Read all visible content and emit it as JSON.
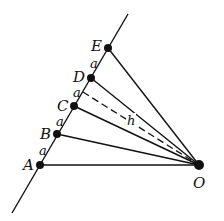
{
  "diagram": {
    "points": [
      {
        "id": "A",
        "label": "A",
        "x": 40,
        "y": 165,
        "lx": 22,
        "ly": 171
      },
      {
        "id": "B",
        "label": "B",
        "x": 57,
        "y": 134,
        "lx": 39,
        "ly": 139
      },
      {
        "id": "C",
        "label": "C",
        "x": 74,
        "y": 106,
        "lx": 56,
        "ly": 110
      },
      {
        "id": "D",
        "label": "D",
        "x": 91,
        "y": 78,
        "lx": 73,
        "ly": 81
      },
      {
        "id": "E",
        "label": "E",
        "x": 108,
        "y": 48,
        "lx": 90,
        "ly": 50
      },
      {
        "id": "O",
        "label": "O",
        "x": 199,
        "y": 165,
        "lx": 193,
        "ly": 190
      }
    ],
    "segment_labels": {
      "AB": "a",
      "BC": "a",
      "CD": "a",
      "DE": "a"
    },
    "height_label": "h",
    "line": {
      "x1": 12,
      "y1": 213,
      "x2": 128,
      "y2": 14
    },
    "dashed_foot": {
      "x": 83,
      "y": 92
    }
  }
}
